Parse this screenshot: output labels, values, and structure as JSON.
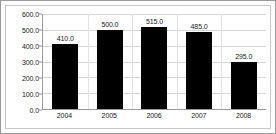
{
  "chart_data": {
    "type": "bar",
    "title": "",
    "subtitle": "",
    "xlabel": "",
    "ylabel": "",
    "categories": [
      "2004",
      "2005",
      "2006",
      "2007",
      "2008"
    ],
    "values": [
      410.0,
      500.0,
      515.0,
      485.0,
      295.0
    ],
    "data_labels": [
      "410.0",
      "500.0",
      "515.0",
      "485.0",
      "295.0"
    ],
    "ylim": [
      0,
      600
    ],
    "ytick_labels": [
      "600.0",
      "500.0",
      "400.0",
      "300.0",
      "200.0",
      "100.0",
      "0.0"
    ],
    "ytick_values": [
      600,
      500,
      400,
      300,
      200,
      100,
      0
    ],
    "grid": true,
    "legend": false,
    "bar_color": "#000000",
    "grid_color": "#d5d5d5",
    "axis_color": "#9a9a9a",
    "text_color": "#1a1a1a",
    "background_color": "#ffffff"
  }
}
